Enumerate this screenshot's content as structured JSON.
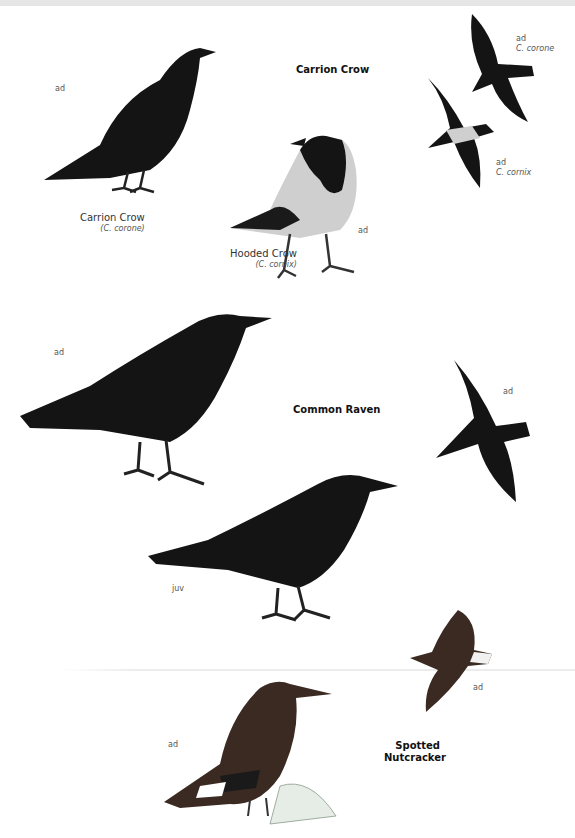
{
  "sections": [
    {
      "title": "Carrion Crow",
      "figures": [
        {
          "age_label": "ad",
          "caption": "Carrion Crow",
          "scientific": "(C. corone)"
        },
        {
          "age_label": "ad",
          "caption": "Hooded Crow",
          "scientific": "(C. cornix)"
        },
        {
          "age_label": "ad",
          "scientific": "C. corone",
          "pose": "flight"
        },
        {
          "age_label": "ad",
          "scientific": "C. cornix",
          "pose": "flight"
        }
      ]
    },
    {
      "title": "Common Raven",
      "figures": [
        {
          "age_label": "ad",
          "pose": "perched"
        },
        {
          "age_label": "ad",
          "pose": "flight"
        },
        {
          "age_label": "juv",
          "pose": "perched"
        }
      ]
    },
    {
      "title_line1": "Spotted",
      "title_line2": "Nutcracker",
      "figures": [
        {
          "age_label": "ad",
          "pose": "perched"
        },
        {
          "age_label": "ad",
          "pose": "flight"
        }
      ]
    }
  ],
  "colors": {
    "bird_black": "#141414",
    "hooded_grey": "#cfcfcf",
    "nutcracker_brown": "#3a2a22",
    "text": "#111111",
    "label": "#555555"
  }
}
